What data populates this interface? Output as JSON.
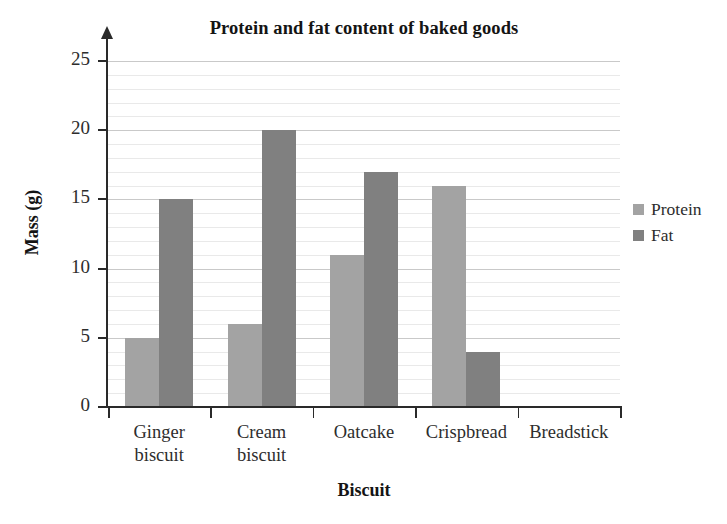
{
  "chart_data": {
    "type": "bar",
    "title": "Protein and fat content of baked goods",
    "xlabel": "Biscuit",
    "ylabel": "Mass (g)",
    "categories": [
      "Ginger biscuit",
      "Cream biscuit",
      "Oatcake",
      "Crispbread",
      "Breadstick"
    ],
    "series": [
      {
        "name": "Protein",
        "color": "#a3a3a3",
        "values": [
          5,
          6,
          11,
          16,
          0
        ]
      },
      {
        "name": "Fat",
        "color": "#808080",
        "values": [
          15,
          20,
          17,
          4,
          0
        ]
      }
    ],
    "ylim": [
      0,
      25
    ],
    "ytick_labels": [
      "0",
      "5",
      "10",
      "15",
      "20",
      "25"
    ],
    "ytick_values": [
      0,
      5,
      10,
      15,
      20,
      25
    ],
    "ytick_step": 5,
    "minor_gridline_step": 1,
    "grid": true,
    "legend_position": "right",
    "axis_color": "#2a2a2a",
    "gridline_color": "#e9e9e9",
    "major_gridline_color": "#c9c9c9",
    "background": "#ffffff"
  }
}
